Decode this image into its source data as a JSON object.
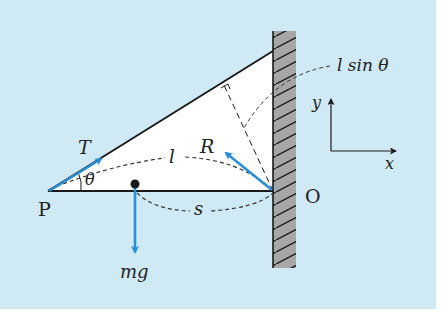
{
  "figure": {
    "background_color": "#cfe9f5",
    "triangle_fill": "#ffffff",
    "force_color": "#2a8fd6",
    "wall_color": "#a6a6a6",
    "line_color": "#1a1a1a"
  },
  "labels": {
    "point_p": "P",
    "point_o": "O",
    "tension": "T",
    "reaction": "R",
    "weight": "mg",
    "angle": "θ",
    "rod_length": "l",
    "com_distance": "s",
    "perpendicular": "l sin θ",
    "axis_x": "x",
    "axis_y": "y"
  },
  "elements": {
    "wall": "hatched-wall",
    "rod": "horizontal-rod-PO",
    "rope": "rope-from-P-to-wall",
    "center_of_mass": "dot-on-rod"
  }
}
